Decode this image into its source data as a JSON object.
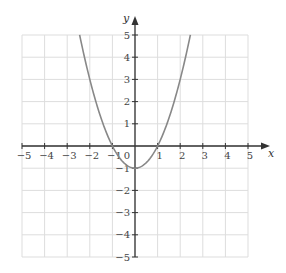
{
  "chart_data": {
    "type": "line",
    "title": "",
    "xlabel": "x",
    "ylabel": "y",
    "xlim": [
      -5,
      5
    ],
    "ylim": [
      -5,
      5
    ],
    "grid": true,
    "legend": null,
    "x_ticks": [
      -5,
      -4,
      -3,
      -2,
      -1,
      0,
      1,
      2,
      3,
      4,
      5
    ],
    "y_ticks": [
      -5,
      -4,
      -3,
      -2,
      -1,
      1,
      2,
      3,
      4,
      5
    ],
    "x_tick_labels": [
      "−5",
      "−4",
      "−3",
      "−2",
      "−1",
      "0",
      "1",
      "2",
      "3",
      "4",
      "5"
    ],
    "y_tick_labels": [
      "−5",
      "−4",
      "−3",
      "−2",
      "−1",
      "1",
      "2",
      "3",
      "4",
      "5"
    ],
    "origin_label": "0",
    "series": [
      {
        "name": "y = x² − 1",
        "equation": "y = x^2 - 1",
        "x": [
          -2.45,
          -2,
          -1.5,
          -1,
          -0.5,
          0,
          0.5,
          1,
          1.5,
          2,
          2.45
        ],
        "y": [
          5,
          3,
          1.25,
          0,
          -0.75,
          -1,
          -0.75,
          0,
          1.25,
          3,
          5
        ],
        "color": "#888888"
      }
    ]
  },
  "colors": {
    "axis": "#333333",
    "grid": "#dddddd",
    "curve": "#888888",
    "text": "#444444"
  }
}
